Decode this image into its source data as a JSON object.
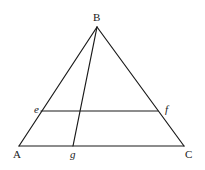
{
  "diagram": {
    "type": "geometry-triangle",
    "points": {
      "B": {
        "label": "B",
        "x": 97,
        "y": 27
      },
      "A": {
        "label": "A",
        "x": 19,
        "y": 146
      },
      "C": {
        "label": "C",
        "x": 184,
        "y": 146
      },
      "e": {
        "label": "e",
        "x": 41,
        "y": 111
      },
      "f": {
        "label": "f",
        "x": 158,
        "y": 111
      },
      "g": {
        "label": "g",
        "x": 73,
        "y": 146
      }
    },
    "segments": [
      {
        "from": "B",
        "to": "A"
      },
      {
        "from": "B",
        "to": "C"
      },
      {
        "from": "A",
        "to": "C"
      },
      {
        "from": "e",
        "to": "f"
      },
      {
        "from": "B",
        "to": "g"
      }
    ],
    "labels": {
      "B": "B",
      "A": "A",
      "C": "C",
      "e": "e",
      "f": "f",
      "g": "g"
    }
  }
}
